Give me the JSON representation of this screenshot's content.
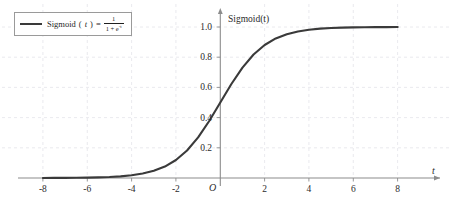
{
  "chart_data": {
    "type": "line",
    "title": "",
    "xlabel": "t",
    "ylabel": "Sigmoid(t)",
    "origin_label": "O",
    "xlim": [
      -9,
      9
    ],
    "ylim": [
      0,
      1.08
    ],
    "xticks": [
      -8,
      -6,
      -4,
      -2,
      2,
      4,
      6,
      8
    ],
    "xtick_labels": [
      "-8",
      "-6",
      "-4",
      "-2",
      "2",
      "4",
      "6",
      "8"
    ],
    "yticks": [
      0.2,
      0.4,
      0.6,
      0.8,
      1.0
    ],
    "ytick_labels": [
      "0.2",
      "0.4",
      "0.6",
      "0.8",
      "1.0"
    ],
    "grid": true,
    "grid_style": "dashed",
    "legend_position": "upper-left",
    "series": [
      {
        "name": "Sigmoid(t) = 1 / (1 + e^-t)",
        "color": "#3a3a3a",
        "x": [
          -8.0,
          -7.5,
          -7.0,
          -6.5,
          -6.0,
          -5.5,
          -5.0,
          -4.5,
          -4.0,
          -3.5,
          -3.0,
          -2.5,
          -2.0,
          -1.5,
          -1.0,
          -0.5,
          0.0,
          0.5,
          1.0,
          1.5,
          2.0,
          2.5,
          3.0,
          3.5,
          4.0,
          4.5,
          5.0,
          5.5,
          6.0,
          6.5,
          7.0,
          7.5,
          8.0
        ],
        "y": [
          0.0003,
          0.0006,
          0.0009,
          0.0015,
          0.0025,
          0.0041,
          0.0067,
          0.011,
          0.018,
          0.0293,
          0.0474,
          0.0759,
          0.1192,
          0.1824,
          0.2689,
          0.3775,
          0.5,
          0.6225,
          0.7311,
          0.8176,
          0.8808,
          0.9241,
          0.9526,
          0.9707,
          0.982,
          0.989,
          0.9933,
          0.9959,
          0.9975,
          0.9985,
          0.9991,
          0.9994,
          0.9997
        ]
      }
    ]
  },
  "legend": {
    "entry_prefix": "Sigmoid",
    "entry_var": "t",
    "equals": "=",
    "numerator": "1",
    "denominator_base": "1 + e",
    "denominator_exp": "-t",
    "full_text": "Sigmoid(t) = 1/(1+e^-t)"
  },
  "colors": {
    "curve": "#3a3a3a",
    "axis": "#8c8c8c",
    "grid": "#e4e4ea",
    "legend_border": "#9a9a9a",
    "text": "#2b2b2b",
    "background": "#ffffff"
  }
}
